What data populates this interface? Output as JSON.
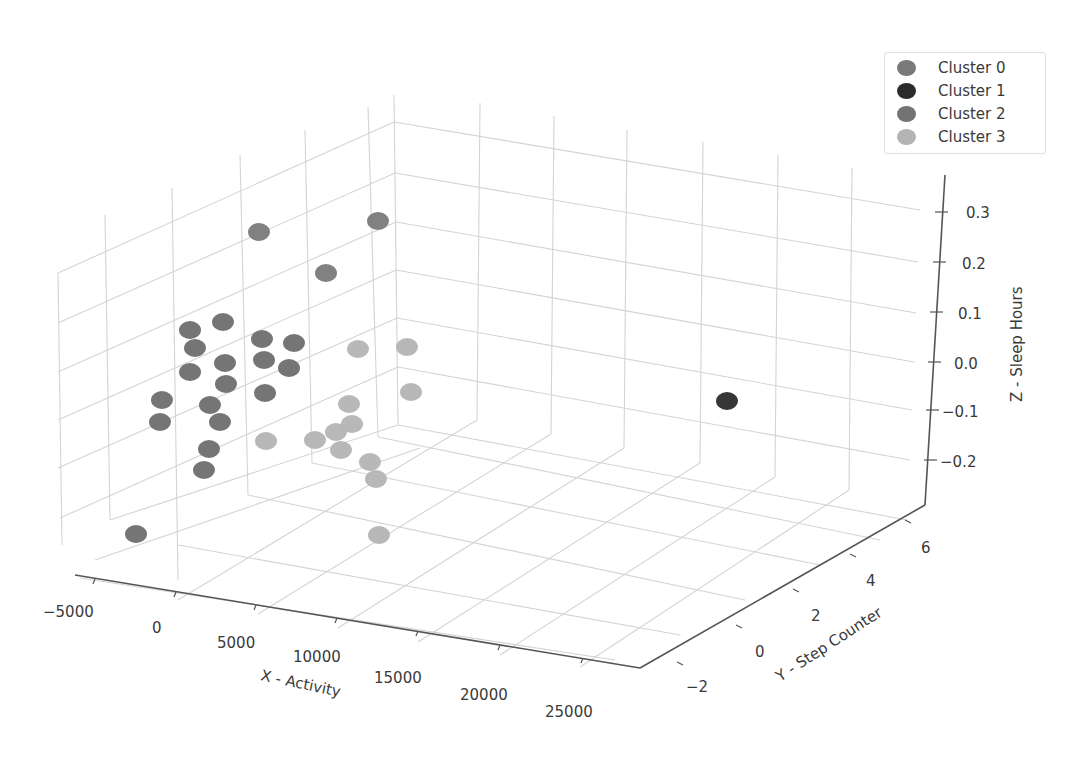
{
  "chart_data": {
    "type": "scatter3d",
    "title": "",
    "xlabel": "X - Activity",
    "ylabel": "Y - Step Counter",
    "zlabel": "Z - Sleep Hours",
    "x_ticks": [
      "−5000",
      "0",
      "5000",
      "10000",
      "15000",
      "20000",
      "25000"
    ],
    "y_ticks": [
      "−2",
      "0",
      "2",
      "4",
      "6"
    ],
    "z_ticks": [
      "0.3",
      "0.2",
      "0.1",
      "0.0",
      "−0.1",
      "−0.2"
    ],
    "xlim": [
      -6000,
      27000
    ],
    "ylim": [
      -3,
      7
    ],
    "zlim": [
      -0.28,
      0.36
    ],
    "grid": true,
    "legend_position": "upper right",
    "legend": [
      {
        "label": "Cluster 0",
        "color": "#7a7a7a"
      },
      {
        "label": "Cluster 1",
        "color": "#2b2b2b"
      },
      {
        "label": "Cluster 2",
        "color": "#737373"
      },
      {
        "label": "Cluster 3",
        "color": "#b4b4b4"
      }
    ],
    "series": [
      {
        "name": "Cluster 0",
        "color": "#7a7a7a",
        "screen_points": [
          [
            259,
            232
          ],
          [
            378,
            221
          ],
          [
            326,
            273
          ]
        ]
      },
      {
        "name": "Cluster 1",
        "color": "#2b2b2b",
        "screen_points": [
          [
            727,
            401
          ]
        ]
      },
      {
        "name": "Cluster 2",
        "color": "#6e6e6e",
        "screen_points": [
          [
            190,
            330
          ],
          [
            223,
            322
          ],
          [
            195,
            348
          ],
          [
            262,
            339
          ],
          [
            294,
            343
          ],
          [
            225,
            363
          ],
          [
            264,
            360
          ],
          [
            190,
            372
          ],
          [
            289,
            368
          ],
          [
            226,
            384
          ],
          [
            265,
            393
          ],
          [
            162,
            400
          ],
          [
            210,
            405
          ],
          [
            160,
            422
          ],
          [
            220,
            422
          ],
          [
            209,
            449
          ],
          [
            204,
            470
          ],
          [
            136,
            534
          ]
        ]
      },
      {
        "name": "Cluster 3",
        "color": "#b4b4b4",
        "screen_points": [
          [
            358,
            349
          ],
          [
            407,
            347
          ],
          [
            411,
            392
          ],
          [
            349,
            404
          ],
          [
            266,
            441
          ],
          [
            315,
            440
          ],
          [
            336,
            432
          ],
          [
            352,
            424
          ],
          [
            341,
            450
          ],
          [
            370,
            462
          ],
          [
            376,
            479
          ],
          [
            379,
            535
          ]
        ]
      }
    ]
  }
}
